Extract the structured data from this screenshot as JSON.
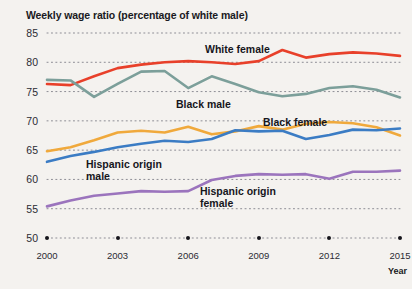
{
  "chart_data": {
    "type": "line",
    "title": "Weekly wage ratio (percentage of white male)",
    "xlabel": "Year",
    "ylabel": "",
    "xlim": [
      2000,
      2015
    ],
    "ylim": [
      50,
      85
    ],
    "yticks": [
      50,
      55,
      60,
      65,
      70,
      75,
      80,
      85
    ],
    "xticks": [
      2000,
      2003,
      2006,
      2009,
      2012,
      2015
    ],
    "x": [
      2000,
      2001,
      2002,
      2003,
      2004,
      2005,
      2006,
      2007,
      2008,
      2009,
      2010,
      2011,
      2012,
      2013,
      2014,
      2015
    ],
    "grid": "dotted-horizontal",
    "legend": "inline-labels",
    "series": [
      {
        "name": "White female",
        "color": "#e8402a",
        "label_text": "White female",
        "values": [
          76.3,
          76.1,
          77.6,
          79.0,
          79.6,
          80.0,
          80.2,
          80.0,
          79.7,
          80.2,
          82.1,
          80.8,
          81.4,
          81.7,
          81.5,
          81.1
        ]
      },
      {
        "name": "Black male",
        "color": "#7c9f9a",
        "label_text": "Black male",
        "values": [
          77.0,
          76.9,
          74.1,
          76.3,
          78.4,
          78.5,
          75.6,
          77.6,
          76.3,
          74.9,
          74.2,
          74.6,
          75.6,
          75.9,
          75.3,
          74.0
        ]
      },
      {
        "name": "Black female",
        "color": "#f0a93c",
        "label_text": "Black female",
        "values": [
          64.8,
          65.5,
          66.7,
          68.0,
          68.3,
          68.0,
          69.0,
          67.7,
          68.2,
          69.1,
          68.5,
          69.5,
          69.8,
          69.6,
          68.9,
          67.5
        ]
      },
      {
        "name": "Hispanic origin male",
        "color": "#3b7cc4",
        "label_text": "Hispanic origin\nmale",
        "values": [
          63.0,
          64.0,
          64.7,
          65.5,
          66.1,
          66.6,
          66.4,
          66.9,
          68.4,
          68.2,
          68.3,
          66.9,
          67.6,
          68.5,
          68.4,
          68.7
        ]
      },
      {
        "name": "Hispanic origin female",
        "color": "#9b74bd",
        "label_text": "Hispanic origin\nfemale",
        "values": [
          55.4,
          56.4,
          57.2,
          57.6,
          58.0,
          57.9,
          58.0,
          59.9,
          60.6,
          60.9,
          60.8,
          60.9,
          60.1,
          61.3,
          61.3,
          61.5
        ]
      }
    ]
  }
}
